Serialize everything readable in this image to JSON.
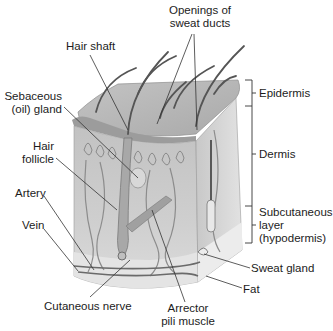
{
  "diagram": {
    "labels": {
      "openings_of_sweat_ducts": [
        "Openings of",
        "sweat ducts"
      ],
      "hair_shaft": "Hair shaft",
      "sebaceous_gland": [
        "Sebaceous",
        "(oil) gland"
      ],
      "hair_follicle": [
        "Hair",
        "follicle"
      ],
      "artery": "Artery",
      "vein": "Vein",
      "cutaneous_nerve": "Cutaneous nerve",
      "arrector_pili_muscle": [
        "Arrector",
        "pili muscle"
      ],
      "fat": "Fat",
      "sweat_gland": "Sweat gland"
    },
    "layers": {
      "epidermis": "Epidermis",
      "dermis": "Dermis",
      "subcutaneous": [
        "Subcutaneous",
        "layer",
        "(hypodermis)"
      ]
    },
    "colors": {
      "epidermis_fill": "#b9b9b9",
      "dermis_fill": "#cfcfcf",
      "fat_fill": "#e6e6e6",
      "hair": "#555555",
      "leader_line": "#333333"
    }
  }
}
